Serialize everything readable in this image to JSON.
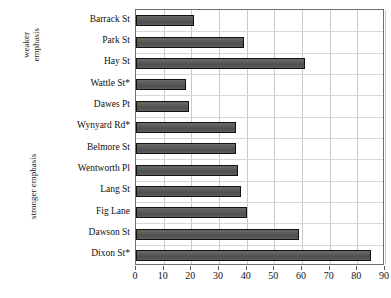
{
  "chart_data": {
    "type": "bar",
    "orientation": "horizontal",
    "title": "",
    "subtitle": "",
    "xlabel": "",
    "ylabel": "",
    "xlim": [
      0,
      90
    ],
    "ylim": null,
    "grid": true,
    "legend": null,
    "xticks": [
      0,
      10,
      20,
      30,
      40,
      50,
      60,
      70,
      80,
      90
    ],
    "categories": [
      "Barrack St",
      "Park St",
      "Hay St",
      "Wattle St*",
      "Dawes Pt",
      "Wynyard Rd*",
      "Belmore St",
      "Wentworth Pl",
      "Lang St",
      "Fig Lane",
      "Dawson St",
      "Dixon St*"
    ],
    "values": [
      21,
      39,
      61,
      18,
      19,
      36,
      36,
      37,
      38,
      40,
      59,
      85
    ],
    "series": [
      {
        "name": "",
        "values": [
          21,
          39,
          61,
          18,
          19,
          36,
          36,
          37,
          38,
          40,
          59,
          85
        ]
      }
    ],
    "annotations": {
      "group_weaker_line1": "weaker",
      "group_weaker_line2": "emphasis",
      "group_stronger": "stronger emphasis"
    },
    "colors": {
      "bar_fill": "#545454",
      "bar_border": "#111111",
      "gridline": "#c9c9c9",
      "frame": "#6e6e6e",
      "text": "#0f0f0f",
      "background": "#ffffff"
    }
  }
}
